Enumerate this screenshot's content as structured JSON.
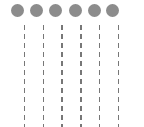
{
  "diagram": {
    "dot_color": "#8c8c8c",
    "line_color": "#777777",
    "dots": [
      {
        "cx": 17.5
      },
      {
        "cx": 36.5
      },
      {
        "cx": 55.5
      },
      {
        "cx": 75
      },
      {
        "cx": 94
      },
      {
        "cx": 112.5
      }
    ],
    "lines": [
      {
        "x": 24.5
      },
      {
        "x": 43.5
      },
      {
        "x": 62
      },
      {
        "x": 81
      },
      {
        "x": 99.5
      },
      {
        "x": 118.5
      }
    ]
  }
}
